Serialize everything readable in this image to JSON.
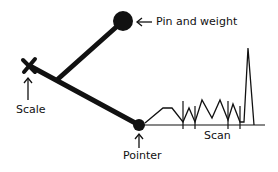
{
  "diagram": {
    "labels": {
      "pin": "Pin and weight",
      "scale": "Scale",
      "pointer": "Pointer",
      "scan": "Scan"
    },
    "colors": {
      "ink": "#111111",
      "background": "#ffffff"
    },
    "geometry": {
      "pin_center": [
        123,
        21
      ],
      "pin_radius": 10,
      "junction": [
        58,
        79
      ],
      "scale_end": [
        29,
        65
      ],
      "pointer_center": [
        139,
        125
      ],
      "pointer_radius": 6,
      "baseline_y": 125,
      "baseline_x": [
        139,
        265
      ],
      "ticks_x": [
        183,
        195,
        228,
        240
      ],
      "waveform": [
        [
          145,
          123
        ],
        [
          163,
          108
        ],
        [
          172,
          108
        ],
        [
          183,
          122
        ],
        [
          189,
          108
        ],
        [
          195,
          122
        ],
        [
          202,
          100
        ],
        [
          212,
          118
        ],
        [
          220,
          100
        ],
        [
          228,
          120
        ],
        [
          233,
          104
        ],
        [
          240,
          122
        ],
        [
          244,
          122
        ],
        [
          248,
          48
        ],
        [
          254,
          125
        ]
      ]
    }
  }
}
